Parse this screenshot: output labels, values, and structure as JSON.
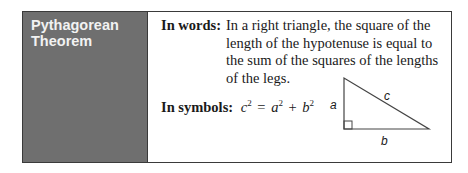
{
  "sidebar": {
    "title": "Pythagorean\nTheorem"
  },
  "words": {
    "label": "In words:",
    "text": "In a right triangle, the square of the length of the hypotenuse is equal to the sum of the squares of the lengths of the legs."
  },
  "symbols": {
    "label": "In symbols:",
    "c": "c",
    "a": "a",
    "b": "b",
    "exp": "2",
    "eq": "=",
    "plus": "+"
  },
  "triangle": {
    "leg_a": "a",
    "leg_b": "b",
    "hypotenuse": "c"
  }
}
